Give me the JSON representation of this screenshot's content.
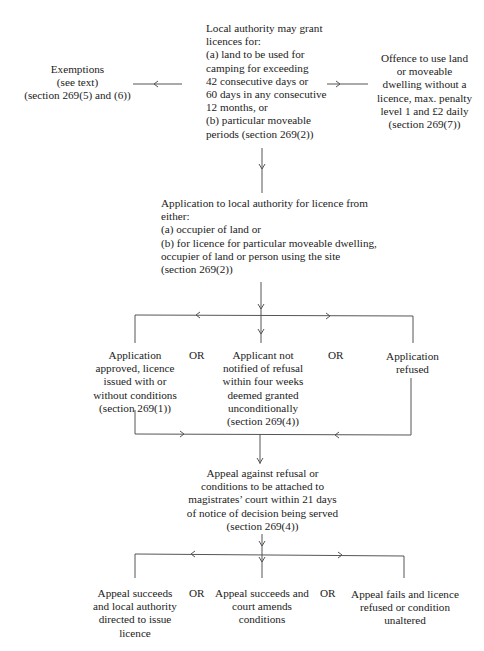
{
  "diagram": {
    "type": "flowchart",
    "nodes": {
      "local_authority": {
        "text": "Local authority may grant\nlicences for:\n(a) land to be used for\ncamping for exceeding\n42 consecutive days or\n60 days in any consecutive\n12 months, or\n(b) particular moveable\nperiods (section 269(2))"
      },
      "exemptions": {
        "text": "Exemptions\n(see text)\n(section 269(5) and (6))"
      },
      "offence": {
        "text": "Offence to use land\nor moveable\ndwelling without a\nlicence, max. penalty\nlevel 1 and £2 daily\n(section 269(7))"
      },
      "application": {
        "text": "Application to local authority for licence from\neither:\n(a) occupier of land or\n(b) for licence for particular moveable dwelling,\noccupier of land or person using the site\n(section 269(2))"
      },
      "approved": {
        "text": "Application\napproved, licence\nissued with or\nwithout conditions\n(section 269(1))"
      },
      "not_notified": {
        "text": "Applicant not\nnotified of refusal\nwithin four weeks\ndeemed granted\nunconditionally\n(section 269(4))"
      },
      "refused": {
        "text": "Application\nrefused"
      },
      "appeal": {
        "text": "Appeal against refusal or\nconditions to be attached to\nmagistrates’ court within 21 days\nof notice of decision being served\n(section 269(4))"
      },
      "appeal_issue": {
        "text": "Appeal succeeds\nand local authority\ndirected to issue\nlicence"
      },
      "appeal_amends": {
        "text": "Appeal succeeds and\ncourt amends\nconditions"
      },
      "appeal_fails": {
        "text": "Appeal fails and licence\nrefused or condition\nunaltered"
      }
    },
    "or_labels": {
      "row1_left": "OR",
      "row1_right": "OR",
      "row2_left": "OR",
      "row2_right": "OR"
    },
    "edges": [
      {
        "from": "local_authority",
        "to": "exemptions"
      },
      {
        "from": "local_authority",
        "to": "offence"
      },
      {
        "from": "local_authority",
        "to": "application"
      },
      {
        "from": "application",
        "to": "approved"
      },
      {
        "from": "application",
        "to": "not_notified"
      },
      {
        "from": "application",
        "to": "refused"
      },
      {
        "from": "approved",
        "to": "appeal"
      },
      {
        "from": "refused",
        "to": "appeal"
      },
      {
        "from": "appeal",
        "to": "appeal_issue"
      },
      {
        "from": "appeal",
        "to": "appeal_amends"
      },
      {
        "from": "appeal",
        "to": "appeal_fails"
      }
    ],
    "colors": {
      "line": "#555555",
      "text": "#222222",
      "background": "#ffffff"
    }
  }
}
